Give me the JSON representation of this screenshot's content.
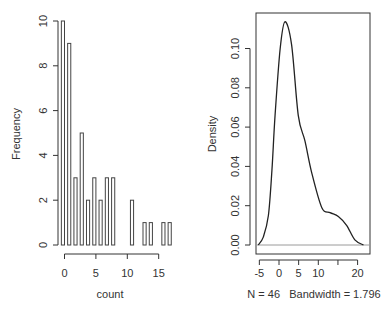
{
  "chart_data": [
    {
      "type": "bar",
      "title": "",
      "xlabel": "count",
      "ylabel": "Frequency",
      "xlim": [
        0,
        17
      ],
      "ylim": [
        0,
        10
      ],
      "x_ticks": [
        0,
        5,
        10,
        15
      ],
      "y_ticks": [
        0,
        2,
        4,
        6,
        8,
        10
      ],
      "bin_width": 0.5,
      "bins": [
        {
          "x": 0,
          "count": 10
        },
        {
          "x": 1,
          "count": 9
        },
        {
          "x": 2,
          "count": 3
        },
        {
          "x": 3,
          "count": 5
        },
        {
          "x": 4,
          "count": 2
        },
        {
          "x": 5,
          "count": 3
        },
        {
          "x": 6,
          "count": 2
        },
        {
          "x": 7,
          "count": 3
        },
        {
          "x": 8,
          "count": 3
        },
        {
          "x": 11,
          "count": 2
        },
        {
          "x": 13,
          "count": 1
        },
        {
          "x": 14,
          "count": 1
        },
        {
          "x": 16,
          "count": 1
        },
        {
          "x": 17,
          "count": 1
        }
      ],
      "grid": false
    },
    {
      "type": "line",
      "title": "",
      "xlabel": "N = 46   Bandwidth = 1.796",
      "ylabel": "Density",
      "xlim": [
        -6,
        23
      ],
      "ylim": [
        0,
        0.116
      ],
      "x_ticks": [
        -5,
        0,
        5,
        10,
        15,
        20
      ],
      "x_tick_labels": [
        "-5",
        "0",
        "5",
        "10",
        "",
        "20"
      ],
      "y_ticks": [
        0.0,
        0.02,
        0.04,
        0.06,
        0.08,
        0.1
      ],
      "y_tick_labels": [
        "0.00",
        "0.02",
        "0.04",
        "0.06",
        "0.08",
        "0.10"
      ],
      "series": [
        {
          "name": "density(count)",
          "x": [
            -5.3,
            -4.0,
            -2.7,
            -1.8,
            -1.0,
            0.3,
            1.5,
            3.2,
            4.9,
            6.6,
            8.3,
            10.9,
            13.0,
            15.1,
            17.2,
            19.3,
            21.5
          ],
          "y": [
            0.0,
            0.004,
            0.015,
            0.038,
            0.066,
            0.1,
            0.1136,
            0.102,
            0.066,
            0.053,
            0.037,
            0.019,
            0.0165,
            0.0145,
            0.01,
            0.0026,
            0.0
          ]
        }
      ],
      "n": 46,
      "bandwidth": 1.796,
      "grid": false
    }
  ]
}
